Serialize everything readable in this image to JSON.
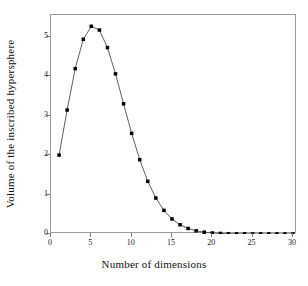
{
  "chart_data": {
    "type": "line",
    "title": "",
    "subtitle": "",
    "xlabel": "Number of dimensions",
    "ylabel": "Volume of the inscribed hypersphere",
    "xlim": [
      0,
      30.5
    ],
    "ylim": [
      0,
      5.55
    ],
    "xticks": [
      0,
      5,
      10,
      15,
      20,
      25,
      30
    ],
    "xtick_labels": [
      "0",
      "5",
      "10",
      "15",
      "20",
      "25",
      "30"
    ],
    "yticks": [
      0,
      1,
      2,
      3,
      4,
      5
    ],
    "ytick_labels": [
      "0",
      "1",
      "2",
      "3",
      "4",
      "5"
    ],
    "grid": false,
    "legend": null,
    "legend_position": "none",
    "marker": "filled-square",
    "marker_color": "#000000",
    "line_color": "#4d4d4d",
    "box_color": "#9b9b9b",
    "series": [
      {
        "name": "Volume of the inscribed hypersphere",
        "x": [
          1,
          2,
          3,
          4,
          5,
          6,
          7,
          8,
          9,
          10,
          11,
          12,
          13,
          14,
          15,
          16,
          17,
          18,
          19,
          20,
          21,
          22,
          23,
          24,
          25,
          26,
          27,
          28,
          29,
          30
        ],
        "values": [
          2.0,
          3.142,
          4.189,
          4.935,
          5.264,
          5.168,
          4.725,
          4.059,
          3.299,
          2.55,
          1.884,
          1.335,
          0.911,
          0.599,
          0.381,
          0.235,
          0.14,
          0.081,
          0.046,
          0.026,
          0.014,
          0.007,
          0.004,
          0.002,
          0.001,
          0.0005,
          0.0002,
          0.0001,
          0.0001,
          0.0
        ]
      }
    ]
  },
  "axes": {
    "xtick_labels": [
      "0",
      "5",
      "10",
      "15",
      "20",
      "25",
      "30"
    ],
    "ytick_labels": [
      "0",
      "1",
      "2",
      "3",
      "4",
      "5"
    ],
    "xlabel": "Number of dimensions",
    "ylabel": "Volume of the inscribed hypersphere"
  }
}
